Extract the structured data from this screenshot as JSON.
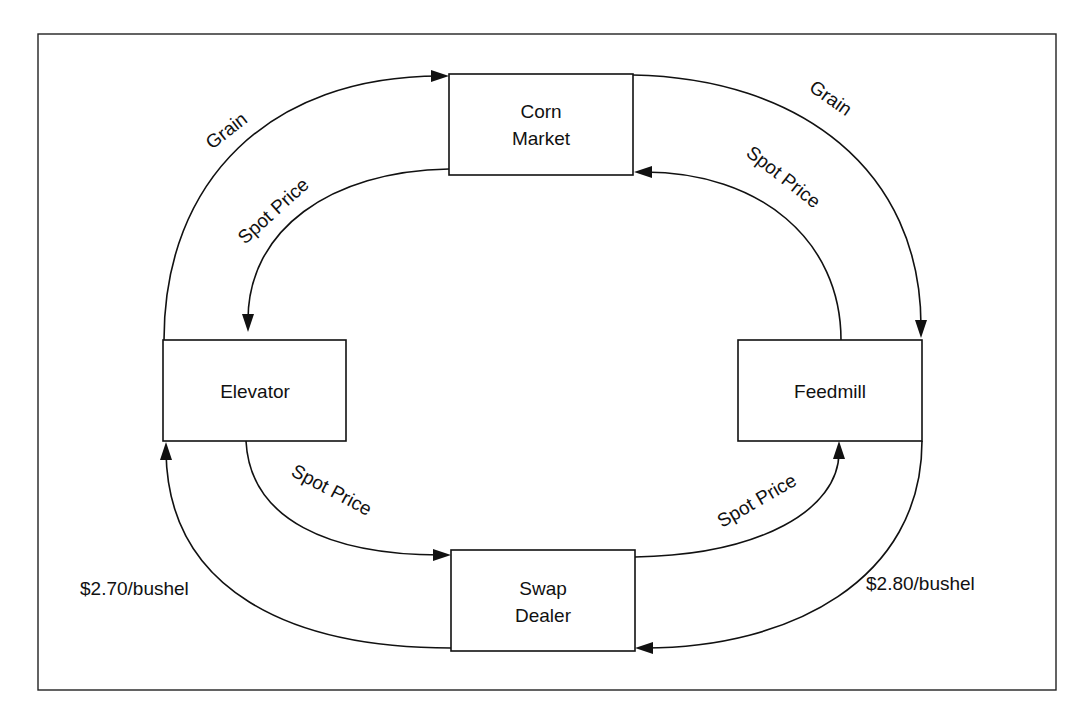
{
  "diagram": {
    "frame": {
      "x": 38,
      "y": 34,
      "width": 1018,
      "height": 656
    },
    "nodes": [
      {
        "id": "corn_market",
        "lines": [
          "Corn",
          "Market"
        ],
        "x": 449,
        "y": 74,
        "width": 184,
        "height": 101
      },
      {
        "id": "elevator",
        "lines": [
          "Elevator"
        ],
        "x": 163,
        "y": 340,
        "width": 183,
        "height": 101
      },
      {
        "id": "feedmill",
        "lines": [
          "Feedmill"
        ],
        "x": 738,
        "y": 340,
        "width": 184,
        "height": 101
      },
      {
        "id": "swap_dealer",
        "lines": [
          "Swap",
          "Dealer"
        ],
        "x": 451,
        "y": 550,
        "width": 184,
        "height": 101
      }
    ],
    "edges": [
      {
        "id": "elevator_to_corn_grain",
        "from": "Elevator",
        "to": "Corn Market",
        "label": "Grain"
      },
      {
        "id": "corn_to_elevator_spot",
        "from": "Corn Market",
        "to": "Elevator",
        "label": "Spot Price"
      },
      {
        "id": "corn_to_feedmill_grain",
        "from": "Corn Market",
        "to": "Feedmill",
        "label": "Grain"
      },
      {
        "id": "feedmill_to_corn_spot",
        "from": "Feedmill",
        "to": "Corn Market",
        "label": "Spot Price"
      },
      {
        "id": "elevator_to_swap_spot",
        "from": "Elevator",
        "to": "Swap Dealer",
        "label": "Spot Price"
      },
      {
        "id": "swap_to_elevator_fixed",
        "from": "Swap Dealer",
        "to": "Elevator",
        "label": "$2.70/bushel"
      },
      {
        "id": "swap_to_feedmill_spot",
        "from": "Swap Dealer",
        "to": "Feedmill",
        "label": "Spot Price"
      },
      {
        "id": "feedmill_to_swap_fixed",
        "from": "Feedmill",
        "to": "Swap Dealer",
        "label": "$2.80/bushel"
      }
    ]
  },
  "labels": {
    "corn_market_l1": "Corn",
    "corn_market_l2": "Market",
    "elevator": "Elevator",
    "feedmill": "Feedmill",
    "swap_dealer_l1": "Swap",
    "swap_dealer_l2": "Dealer",
    "grain_left": "Grain",
    "grain_right": "Grain",
    "spot_top_left": "Spot Price",
    "spot_top_right": "Spot Price",
    "spot_bottom_left": "Spot Price",
    "spot_bottom_right": "Spot Price",
    "price_left": "$2.70/bushel",
    "price_right": "$2.80/bushel"
  }
}
